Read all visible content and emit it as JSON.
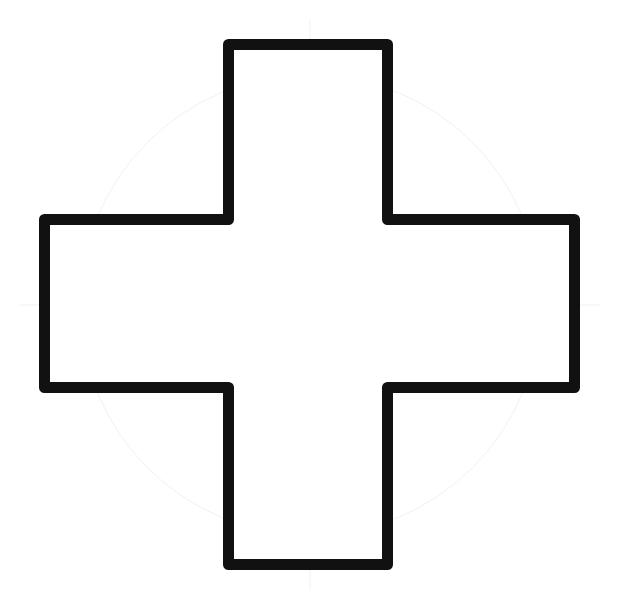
{
  "diagram": {
    "shape": "cross",
    "stroke_color": "#111111",
    "fill_color": "#ffffff",
    "background_color": "#ffffff",
    "stroke_width": 11,
    "bounds": {
      "x_min": 39,
      "x_max": 580,
      "y_min": 39,
      "y_max": 570
    },
    "vertical_bar": {
      "x_min": 223,
      "x_max": 393
    },
    "horizontal_bar": {
      "y_min": 214,
      "y_max": 393
    }
  }
}
